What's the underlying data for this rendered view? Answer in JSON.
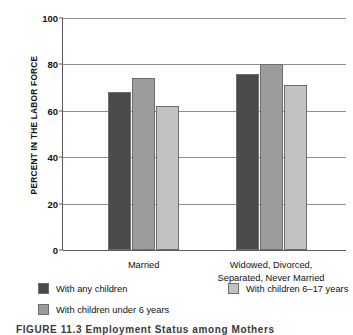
{
  "chart_data": {
    "type": "bar",
    "title": "",
    "xlabel": "",
    "ylabel": "PERCENT IN THE LABOR FORCE",
    "ylim": [
      0,
      100
    ],
    "ytick_labels": [
      "0",
      "20",
      "40",
      "60",
      "80",
      "100"
    ],
    "ytick_values": [
      0,
      20,
      40,
      60,
      80,
      100
    ],
    "grid": true,
    "legend_position": "bottom",
    "categories": [
      "Married",
      "Widowed, Divorced,\nSeparated, Never Married"
    ],
    "category_labels": [
      {
        "line1": "Married",
        "line2": ""
      },
      {
        "line1": "Widowed, Divorced,",
        "line2": "Separated, Never Married"
      }
    ],
    "series": [
      {
        "name": "With any children",
        "color": "#4a4a4a",
        "values": [
          68,
          76
        ]
      },
      {
        "name": "With children under 6 years",
        "color": "#9c9c9c",
        "values": [
          74,
          80
        ]
      },
      {
        "name": "With children 6–17 years",
        "color": "#c2c2c2",
        "values": [
          62,
          71
        ]
      }
    ]
  },
  "legend": {
    "items": [
      {
        "label": "With any children",
        "color": "#4a4a4a"
      },
      {
        "label": "With children under 6 years",
        "color": "#9c9c9c"
      },
      {
        "label": "With children 6–17 years",
        "color": "#c2c2c2"
      }
    ]
  },
  "caption": {
    "text": "FIGURE 11.3   Employment Status among Mothers"
  }
}
